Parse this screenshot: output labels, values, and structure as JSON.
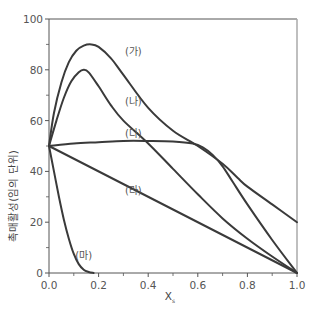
{
  "chart_data": {
    "type": "line",
    "title": "",
    "xlabel": "X",
    "xlabel_subscript": "s",
    "ylabel": "촉매활성(임의 단위)",
    "xlim": [
      0.0,
      1.0
    ],
    "ylim": [
      0,
      100
    ],
    "xticks": [
      "0.0",
      "0.2",
      "0.4",
      "0.6",
      "0.8",
      "1.0"
    ],
    "yticks": [
      "0",
      "20",
      "40",
      "60",
      "80",
      "100"
    ],
    "grid": false,
    "legend": "inline curve labels",
    "series": [
      {
        "name": "(가)",
        "label_pos": [
          0.34,
          86
        ],
        "points": [
          [
            0.0,
            50
          ],
          [
            0.02,
            63
          ],
          [
            0.05,
            75
          ],
          [
            0.08,
            83
          ],
          [
            0.11,
            87.5
          ],
          [
            0.14,
            89.5
          ],
          [
            0.17,
            90
          ],
          [
            0.2,
            89
          ],
          [
            0.25,
            84.5
          ],
          [
            0.3,
            78
          ],
          [
            0.4,
            65
          ],
          [
            0.5,
            56
          ],
          [
            0.6,
            50
          ],
          [
            0.7,
            43
          ],
          [
            0.76,
            37.5
          ],
          [
            0.8,
            34
          ],
          [
            0.9,
            27
          ],
          [
            1.0,
            20
          ]
        ]
      },
      {
        "name": "(나)",
        "label_pos": [
          0.34,
          66
        ],
        "points": [
          [
            0.0,
            50
          ],
          [
            0.03,
            60
          ],
          [
            0.06,
            69
          ],
          [
            0.09,
            75.5
          ],
          [
            0.12,
            79
          ],
          [
            0.14,
            80
          ],
          [
            0.16,
            79
          ],
          [
            0.2,
            73.5
          ],
          [
            0.25,
            66
          ],
          [
            0.3,
            60
          ],
          [
            0.4,
            51
          ],
          [
            0.5,
            41
          ],
          [
            0.6,
            31
          ],
          [
            0.7,
            21.5
          ],
          [
            0.8,
            13.5
          ],
          [
            0.9,
            6.5
          ],
          [
            1.0,
            0
          ]
        ]
      },
      {
        "name": "(다)",
        "label_pos": [
          0.34,
          53.5
        ],
        "points": [
          [
            0.0,
            50
          ],
          [
            0.1,
            51
          ],
          [
            0.2,
            51.5
          ],
          [
            0.3,
            52
          ],
          [
            0.4,
            52
          ],
          [
            0.5,
            51.8
          ],
          [
            0.58,
            51
          ],
          [
            0.62,
            49.5
          ],
          [
            0.66,
            46.5
          ],
          [
            0.7,
            42
          ],
          [
            0.74,
            36
          ],
          [
            0.8,
            27
          ],
          [
            0.9,
            13
          ],
          [
            1.0,
            0
          ]
        ]
      },
      {
        "name": "(라)",
        "label_pos": [
          0.34,
          31
        ],
        "points": [
          [
            0.0,
            50
          ],
          [
            1.0,
            0
          ]
        ]
      },
      {
        "name": "(마)",
        "label_pos": [
          0.14,
          5.5
        ],
        "points": [
          [
            0.0,
            50
          ],
          [
            0.02,
            40
          ],
          [
            0.04,
            30
          ],
          [
            0.06,
            21
          ],
          [
            0.08,
            13.5
          ],
          [
            0.1,
            7.5
          ],
          [
            0.12,
            3.5
          ],
          [
            0.14,
            1.3
          ],
          [
            0.16,
            0.4
          ],
          [
            0.18,
            0
          ]
        ]
      }
    ]
  },
  "colors": {
    "curve": "#3a3a3a",
    "axis": "#555555",
    "text": "#555555"
  }
}
